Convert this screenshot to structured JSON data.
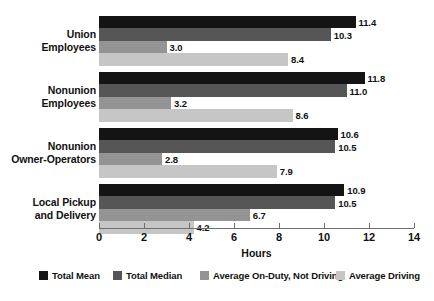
{
  "chart_data": {
    "type": "bar",
    "orientation": "horizontal",
    "title": "",
    "xlabel": "Hours",
    "ylabel": "",
    "xlim": [
      0,
      14
    ],
    "xticks": [
      0,
      2,
      4,
      6,
      8,
      10,
      12,
      14
    ],
    "grid": false,
    "legend_position": "bottom",
    "categories": [
      "Union Employees",
      "Nonunion Employees",
      "Nonunion Owner-Operators",
      "Local Pickup and Delivery"
    ],
    "series": [
      {
        "name": "Total Mean",
        "color": "#141414",
        "values": [
          11.4,
          11.8,
          10.6,
          10.9
        ]
      },
      {
        "name": "Total Median",
        "color": "#565656",
        "values": [
          10.3,
          11.0,
          10.5,
          10.5
        ]
      },
      {
        "name": "Average On-Duty, Not Driving",
        "color": "#949494",
        "values": [
          3.0,
          3.2,
          2.8,
          6.7
        ]
      },
      {
        "name": "Average Driving",
        "color": "#c6c6c6",
        "values": [
          8.4,
          8.6,
          7.9,
          4.2
        ]
      }
    ]
  },
  "categories_display": [
    {
      "line1": "Union",
      "line2": "Employees"
    },
    {
      "line1": "Nonunion",
      "line2": "Employees"
    },
    {
      "line1": "Nonunion",
      "line2": "Owner-Operators"
    },
    {
      "line1": "Local Pickup",
      "line2": "and Delivery"
    }
  ],
  "value_labels": [
    [
      "11.4",
      "10.3",
      "3.0",
      "8.4"
    ],
    [
      "11.8",
      "11.0",
      "3.2",
      "8.6"
    ],
    [
      "10.6",
      "10.5",
      "2.8",
      "7.9"
    ],
    [
      "10.9",
      "10.5",
      "6.7",
      "4.2"
    ]
  ],
  "axis": {
    "tick_labels": [
      "0",
      "2",
      "4",
      "6",
      "8",
      "10",
      "12",
      "14"
    ],
    "title": "Hours"
  },
  "legend": {
    "items": [
      {
        "label": "Total Mean",
        "color": "#141414"
      },
      {
        "label": "Total Median",
        "color": "#565656"
      },
      {
        "label": "Average On-Duty, Not Driving",
        "color": "#949494"
      },
      {
        "label": "Average Driving",
        "color": "#c6c6c6"
      }
    ]
  }
}
